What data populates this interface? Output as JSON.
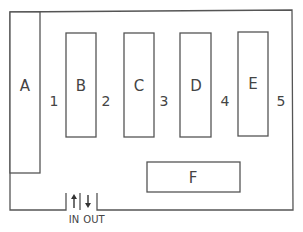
{
  "diagram": {
    "type": "floor-plan",
    "colors": {
      "line": "#555555",
      "text": "#444444",
      "background": "#ffffff"
    },
    "blocks": [
      {
        "id": "A",
        "label": "A"
      },
      {
        "id": "B",
        "label": "B"
      },
      {
        "id": "C",
        "label": "C"
      },
      {
        "id": "D",
        "label": "D"
      },
      {
        "id": "E",
        "label": "E"
      },
      {
        "id": "F",
        "label": "F"
      }
    ],
    "aisles": [
      {
        "label": "1"
      },
      {
        "label": "2"
      },
      {
        "label": "3"
      },
      {
        "label": "4"
      },
      {
        "label": "5"
      }
    ],
    "entrance": {
      "in_label": "IN",
      "out_label": "OUT",
      "in_icon": "arrow-up-icon",
      "out_icon": "arrow-down-icon"
    }
  }
}
